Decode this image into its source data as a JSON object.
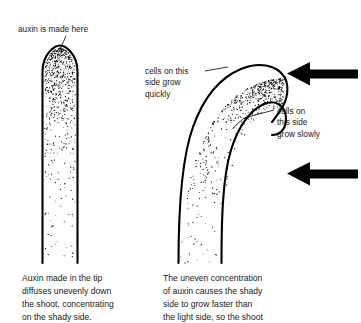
{
  "figure": {
    "background_color": "#ffffff",
    "ink_color": "#000000"
  },
  "labels": {
    "auxin_source": {
      "lines": [
        "auxin is made here"
      ],
      "text": "auxin is made here"
    },
    "shady_side": {
      "lines": [
        "cells on this",
        "side grow",
        "quickly"
      ],
      "text": "cells on this\nside grow\nquickly"
    },
    "light_side": {
      "lines": [
        "cells on",
        "this side",
        "grow slowly"
      ],
      "text": "cells on\nthis side\ngrow slowly"
    }
  },
  "captions": {
    "left": {
      "lines": [
        "Auxin made in the tip",
        "diffuses unevenly down",
        "the shoot, concentrating",
        "on the shady side."
      ],
      "text": "Auxin made in the tip\ndiffuses unevenly down\nthe shoot, concentrating\non the shady side."
    },
    "right": {
      "lines": [
        "The uneven concentration",
        "of auxin causes the shady",
        "side to grow faster than",
        "the light side, so the shoot"
      ],
      "text": "The uneven concentration\nof auxin causes the shady\nside to grow faster than\nthe light side, so the shoot"
    }
  },
  "diagrams": {
    "straight_shoot": {
      "name": "straight vertical shoot with auxin concentrated at the tip",
      "stipple_description": "dense dots at the rounded tip fading downward"
    },
    "bent_shoot": {
      "name": "shoot bent toward the light with auxin concentrated on the shady side",
      "stipple_description": "dots dense along the left shady edge, sparse toward the base"
    }
  },
  "light_arrows": [
    {
      "name": "upper-light-arrow",
      "direction": "left",
      "meaning": "light shining from the right"
    },
    {
      "name": "lower-light-arrow",
      "direction": "left",
      "meaning": "light shining from the right"
    }
  ]
}
